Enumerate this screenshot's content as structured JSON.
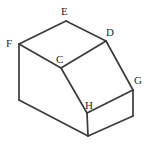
{
  "figure": {
    "canvas": {
      "width": 148,
      "height": 147,
      "background": "#ffffff"
    },
    "stroke_color": "#3b3b3b",
    "stroke_width": 1.7,
    "label_color": "#2a2a2a",
    "vertices": [
      {
        "id": "E",
        "label": "E",
        "x": 66,
        "y": 21,
        "label_x": 61,
        "label_y": 6,
        "labeled": true
      },
      {
        "id": "F",
        "label": "F",
        "x": 19,
        "y": 44,
        "label_x": 6,
        "label_y": 38,
        "labeled": true
      },
      {
        "id": "D",
        "label": "D",
        "x": 106,
        "y": 41,
        "label_x": 106,
        "label_y": 27,
        "labeled": true
      },
      {
        "id": "C",
        "label": "C",
        "x": 61,
        "y": 68,
        "label_x": 56,
        "label_y": 54,
        "labeled": true
      },
      {
        "id": "G",
        "label": "G",
        "x": 133,
        "y": 90,
        "label_x": 134,
        "label_y": 75,
        "labeled": true
      },
      {
        "id": "H",
        "label": "H",
        "x": 87,
        "y": 113,
        "label_x": 85,
        "label_y": 100,
        "labeled": true
      },
      {
        "id": "A",
        "label": "",
        "x": 19,
        "y": 100,
        "label_x": 0,
        "label_y": 0,
        "labeled": false
      },
      {
        "id": "B",
        "label": "",
        "x": 88,
        "y": 136,
        "label_x": 0,
        "label_y": 0,
        "labeled": false
      },
      {
        "id": "I",
        "label": "",
        "x": 133,
        "y": 116,
        "label_x": 0,
        "label_y": 0,
        "labeled": false
      }
    ],
    "edges": [
      {
        "name": "edge-F-E",
        "from": "F",
        "to": "E"
      },
      {
        "name": "edge-E-D",
        "from": "E",
        "to": "D"
      },
      {
        "name": "edge-F-C",
        "from": "F",
        "to": "C"
      },
      {
        "name": "edge-C-D",
        "from": "C",
        "to": "D"
      },
      {
        "name": "edge-D-G",
        "from": "D",
        "to": "G"
      },
      {
        "name": "edge-C-H",
        "from": "C",
        "to": "H"
      },
      {
        "name": "edge-H-G",
        "from": "H",
        "to": "G"
      },
      {
        "name": "edge-F-A",
        "from": "F",
        "to": "A"
      },
      {
        "name": "edge-A-B",
        "from": "A",
        "to": "B"
      },
      {
        "name": "edge-H-B",
        "from": "H",
        "to": "B"
      },
      {
        "name": "edge-B-I",
        "from": "B",
        "to": "I"
      },
      {
        "name": "edge-G-I",
        "from": "G",
        "to": "I"
      }
    ],
    "labels_text": {
      "E": "E",
      "F": "F",
      "D": "D",
      "C": "C",
      "G": "G",
      "H": "H"
    }
  }
}
